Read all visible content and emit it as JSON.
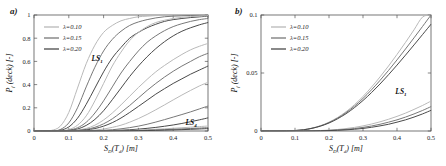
{
  "figure": {
    "panels": [
      {
        "id": "a",
        "label": "a)",
        "xlabel": "S",
        "xlabel_sub1": "D",
        "xlabel_mid": "(T",
        "xlabel_sub2": "d",
        "xlabel_end": ") [m]",
        "ylabel_main": "P",
        "ylabel_sub": "f",
        "ylabel_rest": " (deck) [-]",
        "xticks": [
          "0",
          "0.1",
          "0.2",
          "0.3",
          "0.4",
          "0.5"
        ],
        "yticks": [
          "0",
          "0.2",
          "0.4",
          "0.6",
          "0.8",
          "1"
        ],
        "annotations": [
          {
            "text": "LS",
            "sub": "1",
            "x": 0.165,
            "y": 0.6
          },
          {
            "text": "LS",
            "sub": "4",
            "x": 0.435,
            "y": 0.055
          }
        ]
      },
      {
        "id": "b",
        "label": "b)",
        "xlabel": "S",
        "xlabel_sub1": "D",
        "xlabel_mid": "(T",
        "xlabel_sub2": "d",
        "xlabel_end": ") [m]",
        "ylabel_main": "P",
        "ylabel_sub": "f",
        "ylabel_rest": " (deck) [-]",
        "xticks": [
          "0",
          "0.1",
          "0.2",
          "0.3",
          "0.4",
          "0.5"
        ],
        "yticks": [
          "0",
          "0.05",
          "0.1"
        ],
        "annotations": [
          {
            "text": "LS",
            "sub": "1",
            "x": 0.395,
            "y": 0.0315
          }
        ]
      }
    ],
    "legend": {
      "entries": [
        {
          "label": "λ=0.10",
          "color": "#b9b9b9"
        },
        {
          "label": "λ=0.15",
          "color": "#787878"
        },
        {
          "label": "λ=0.20",
          "color": "#4a4a4a"
        }
      ]
    },
    "colors": {
      "lambda_010": "#b9b9b9",
      "lambda_015": "#787878",
      "lambda_020": "#4a4a4a",
      "axis": "#555555",
      "text": "#1a1a1a",
      "background": "#ffffff"
    }
  },
  "chart_data": [
    {
      "type": "line",
      "panel": "a",
      "title": "",
      "xlabel": "S_D(T_d) [m]",
      "ylabel": "P_f (deck) [-]",
      "xlim": [
        0,
        0.5
      ],
      "ylim": [
        0,
        1
      ],
      "xticks": [
        0,
        0.1,
        0.2,
        0.3,
        0.4,
        0.5
      ],
      "yticks": [
        0,
        0.2,
        0.4,
        0.6,
        0.8,
        1
      ],
      "grid": false,
      "legend_position": "top-left",
      "x": [
        0,
        0.025,
        0.05,
        0.075,
        0.1,
        0.125,
        0.15,
        0.175,
        0.2,
        0.225,
        0.25,
        0.275,
        0.3,
        0.325,
        0.35,
        0.375,
        0.4,
        0.425,
        0.45,
        0.475,
        0.5
      ],
      "series": [
        {
          "name": "LS1 λ=0.10",
          "limit_state": "LS1",
          "lambda": 0.1,
          "color": "#b9b9b9",
          "values": [
            0,
            0,
            0.005,
            0.04,
            0.16,
            0.37,
            0.58,
            0.74,
            0.85,
            0.91,
            0.95,
            0.97,
            0.985,
            0.99,
            0.995,
            0.997,
            0.999,
            1.0,
            1.0,
            1.0,
            1.0
          ]
        },
        {
          "name": "LS1 λ=0.15",
          "limit_state": "LS1",
          "lambda": 0.15,
          "color": "#787878",
          "values": [
            0,
            0,
            0.001,
            0.012,
            0.07,
            0.2,
            0.38,
            0.55,
            0.69,
            0.79,
            0.86,
            0.91,
            0.94,
            0.96,
            0.975,
            0.985,
            0.99,
            0.993,
            0.996,
            0.998,
            0.999
          ]
        },
        {
          "name": "LS1 λ=0.20",
          "limit_state": "LS1",
          "lambda": 0.2,
          "color": "#4a4a4a",
          "values": [
            0,
            0,
            0.0005,
            0.006,
            0.035,
            0.11,
            0.23,
            0.37,
            0.51,
            0.63,
            0.72,
            0.8,
            0.85,
            0.89,
            0.92,
            0.945,
            0.96,
            0.97,
            0.978,
            0.984,
            0.99
          ]
        },
        {
          "name": "LS2 λ=0.10",
          "limit_state": "LS2",
          "lambda": 0.1,
          "color": "#b9b9b9",
          "values": [
            0,
            0,
            0,
            0.002,
            0.012,
            0.05,
            0.13,
            0.26,
            0.41,
            0.56,
            0.68,
            0.78,
            0.85,
            0.9,
            0.935,
            0.955,
            0.97,
            0.98,
            0.986,
            0.99,
            0.994
          ]
        },
        {
          "name": "LS2 λ=0.15",
          "limit_state": "LS2",
          "lambda": 0.15,
          "color": "#787878",
          "values": [
            0,
            0,
            0,
            0.001,
            0.007,
            0.028,
            0.075,
            0.155,
            0.26,
            0.38,
            0.5,
            0.6,
            0.69,
            0.765,
            0.82,
            0.865,
            0.9,
            0.925,
            0.945,
            0.96,
            0.97
          ]
        },
        {
          "name": "LS2 λ=0.20",
          "limit_state": "LS2",
          "lambda": 0.2,
          "color": "#4a4a4a",
          "values": [
            0,
            0,
            0,
            0.0005,
            0.004,
            0.017,
            0.048,
            0.1,
            0.175,
            0.27,
            0.37,
            0.47,
            0.56,
            0.64,
            0.71,
            0.77,
            0.82,
            0.86,
            0.89,
            0.915,
            0.935
          ]
        },
        {
          "name": "LS3 λ=0.10",
          "limit_state": "LS3",
          "lambda": 0.1,
          "color": "#b9b9b9",
          "values": [
            0,
            0,
            0,
            0,
            0.002,
            0.008,
            0.022,
            0.05,
            0.095,
            0.155,
            0.225,
            0.3,
            0.375,
            0.445,
            0.51,
            0.565,
            0.615,
            0.66,
            0.7,
            0.73,
            0.755
          ]
        },
        {
          "name": "LS3 λ=0.15",
          "limit_state": "LS3",
          "lambda": 0.15,
          "color": "#787878",
          "values": [
            0,
            0,
            0,
            0,
            0.001,
            0.005,
            0.014,
            0.032,
            0.062,
            0.105,
            0.16,
            0.22,
            0.285,
            0.35,
            0.41,
            0.465,
            0.515,
            0.56,
            0.6,
            0.64,
            0.67
          ]
        },
        {
          "name": "LS3 λ=0.20",
          "limit_state": "LS3",
          "lambda": 0.2,
          "color": "#4a4a4a",
          "values": [
            0,
            0,
            0,
            0,
            0.0006,
            0.003,
            0.009,
            0.021,
            0.042,
            0.072,
            0.112,
            0.16,
            0.212,
            0.265,
            0.318,
            0.365,
            0.41,
            0.45,
            0.49,
            0.525,
            0.56
          ]
        },
        {
          "name": "LS4 λ=0.10",
          "limit_state": "LS4",
          "lambda": 0.1,
          "color": "#b9b9b9",
          "values": [
            0,
            0,
            0,
            0,
            0,
            0.001,
            0.003,
            0.008,
            0.017,
            0.031,
            0.05,
            0.076,
            0.107,
            0.143,
            0.183,
            0.225,
            0.268,
            0.31,
            0.35,
            0.388,
            0.42
          ]
        },
        {
          "name": "LS4 λ=0.15",
          "limit_state": "LS4",
          "lambda": 0.15,
          "color": "#787878",
          "values": [
            0,
            0,
            0,
            0,
            0,
            0.0004,
            0.0012,
            0.003,
            0.006,
            0.011,
            0.019,
            0.029,
            0.042,
            0.058,
            0.077,
            0.098,
            0.12,
            0.142,
            0.165,
            0.19,
            0.215
          ]
        },
        {
          "name": "LS4 λ=0.20",
          "limit_state": "LS4",
          "lambda": 0.2,
          "color": "#4a4a4a",
          "values": [
            0,
            0,
            0,
            0,
            0,
            0.0001,
            0.0004,
            0.001,
            0.002,
            0.004,
            0.007,
            0.011,
            0.016,
            0.023,
            0.031,
            0.041,
            0.052,
            0.065,
            0.08,
            0.096,
            0.113
          ]
        },
        {
          "name": "LS5 λ=0.10",
          "limit_state": "LS5",
          "lambda": 0.1,
          "color": "#b9b9b9",
          "values": [
            0,
            0,
            0,
            0,
            0,
            0,
            0.0001,
            0.0003,
            0.0008,
            0.0016,
            0.003,
            0.005,
            0.0075,
            0.011,
            0.015,
            0.019,
            0.0235,
            0.028,
            0.033,
            0.038,
            0.043
          ]
        },
        {
          "name": "LS5 λ=0.15",
          "limit_state": "LS5",
          "lambda": 0.15,
          "color": "#787878",
          "values": [
            0,
            0,
            0,
            0,
            0,
            0,
            5e-05,
            0.0002,
            0.0005,
            0.001,
            0.0018,
            0.003,
            0.0046,
            0.0066,
            0.009,
            0.0118,
            0.0148,
            0.018,
            0.0215,
            0.025,
            0.029
          ]
        },
        {
          "name": "LS5 λ=0.20",
          "limit_state": "LS5",
          "lambda": 0.2,
          "color": "#4a4a4a",
          "values": [
            0,
            0,
            0,
            0,
            0,
            0,
            2e-05,
            0.0001,
            0.0003,
            0.0006,
            0.001,
            0.0017,
            0.0027,
            0.004,
            0.0055,
            0.0073,
            0.0094,
            0.0118,
            0.0145,
            0.0175,
            0.0208
          ]
        }
      ]
    },
    {
      "type": "line",
      "panel": "b",
      "title": "",
      "xlabel": "S_D(T_d) [m]",
      "ylabel": "P_f (deck) [-]",
      "xlim": [
        0,
        0.5
      ],
      "ylim": [
        0,
        0.1
      ],
      "xticks": [
        0,
        0.1,
        0.2,
        0.3,
        0.4,
        0.5
      ],
      "yticks": [
        0,
        0.05,
        0.1
      ],
      "grid": false,
      "legend_position": "top-left",
      "x": [
        0,
        0.025,
        0.05,
        0.075,
        0.1,
        0.125,
        0.15,
        0.175,
        0.2,
        0.225,
        0.25,
        0.275,
        0.3,
        0.325,
        0.35,
        0.375,
        0.4,
        0.425,
        0.45,
        0.475,
        0.5
      ],
      "series": [
        {
          "name": "LS1 λ=0.10",
          "limit_state": "LS1",
          "lambda": 0.1,
          "color": "#b9b9b9",
          "values": [
            0,
            0,
            0,
            0.0001,
            0.0004,
            0.0011,
            0.0025,
            0.0046,
            0.0076,
            0.0116,
            0.0166,
            0.0227,
            0.0298,
            0.0378,
            0.0466,
            0.056,
            0.066,
            0.0764,
            0.0872,
            0.0982,
            0.1
          ]
        },
        {
          "name": "LS1 λ=0.15",
          "limit_state": "LS1",
          "lambda": 0.15,
          "color": "#787878",
          "values": [
            0,
            0,
            0,
            0.0001,
            0.0004,
            0.0011,
            0.0024,
            0.0044,
            0.0073,
            0.0111,
            0.0158,
            0.0215,
            0.0281,
            0.0355,
            0.0436,
            0.0522,
            0.0613,
            0.0707,
            0.0803,
            0.0901,
            0.1
          ]
        },
        {
          "name": "LS1 λ=0.20",
          "limit_state": "LS1",
          "lambda": 0.2,
          "color": "#4a4a4a",
          "values": [
            0,
            0,
            0,
            0.0001,
            0.0004,
            0.001,
            0.0023,
            0.0042,
            0.0069,
            0.0105,
            0.0149,
            0.0202,
            0.0263,
            0.0331,
            0.0405,
            0.0485,
            0.0568,
            0.0654,
            0.0742,
            0.0831,
            0.092
          ]
        },
        {
          "name": "LS2 λ=0.10",
          "limit_state": "LS2",
          "lambda": 0.1,
          "color": "#b9b9b9",
          "values": [
            0,
            0,
            0,
            0,
            0,
            0.0001,
            0.0002,
            0.0004,
            0.0008,
            0.0013,
            0.0021,
            0.0031,
            0.0044,
            0.006,
            0.0079,
            0.0101,
            0.0126,
            0.0154,
            0.0186,
            0.022,
            0.0258
          ]
        },
        {
          "name": "LS2 λ=0.15",
          "limit_state": "LS2",
          "lambda": 0.15,
          "color": "#787878",
          "values": [
            0,
            0,
            0,
            0,
            0,
            5e-05,
            0.00012,
            0.00027,
            0.0005,
            0.0009,
            0.0014,
            0.0021,
            0.0031,
            0.0043,
            0.0058,
            0.0076,
            0.0096,
            0.012,
            0.0147,
            0.0177,
            0.021
          ]
        },
        {
          "name": "LS2 λ=0.20",
          "limit_state": "LS2",
          "lambda": 0.2,
          "color": "#4a4a4a",
          "values": [
            0,
            0,
            0,
            0,
            0,
            3e-05,
            8e-05,
            0.00018,
            0.00035,
            0.0006,
            0.001,
            0.0015,
            0.0022,
            0.0032,
            0.0044,
            0.0058,
            0.0076,
            0.0096,
            0.012,
            0.0147,
            0.0178
          ]
        }
      ]
    }
  ]
}
